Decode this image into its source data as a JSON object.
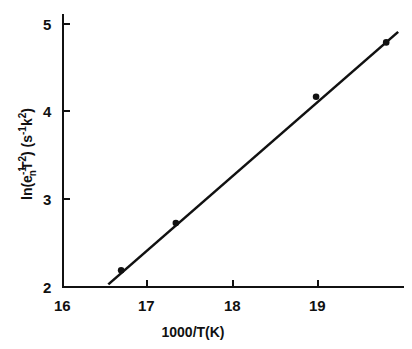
{
  "chart_data": {
    "type": "scatter",
    "title": "",
    "xlabel": "1000/T(K)",
    "ylabel": "ln(e_n^-1 T^2) (s^-1 K^2)",
    "xlim": [
      16,
      20
    ],
    "ylim": [
      2,
      5
    ],
    "xticks": [
      16,
      17,
      18,
      19
    ],
    "yticks": [
      2,
      3,
      4,
      5
    ],
    "grid": false,
    "legend": null,
    "series": [
      {
        "name": "data",
        "type": "scatter",
        "x": [
          16.68,
          17.32,
          18.96,
          19.78
        ],
        "y": [
          2.19,
          2.73,
          4.17,
          4.79
        ]
      },
      {
        "name": "linear fit",
        "type": "line",
        "x": [
          16.53,
          19.92
        ],
        "y": [
          2.03,
          4.91
        ]
      }
    ]
  },
  "labels": {
    "xlabel": "1000/T(K)",
    "ylabel_main": "ln(e",
    "ylabel_sub_n": "n",
    "ylabel_sup1": "-1",
    "ylabel_T": "T",
    "ylabel_sup2": "2",
    "ylabel_units_open": ") (s",
    "ylabel_sup3": "-1",
    "ylabel_K": "k",
    "ylabel_sup4": "2",
    "ylabel_close": ")",
    "xtick_16": "16",
    "xtick_17": "17",
    "xtick_18": "18",
    "xtick_19": "19",
    "ytick_2": "2",
    "ytick_3": "3",
    "ytick_4": "4",
    "ytick_5": "5"
  }
}
